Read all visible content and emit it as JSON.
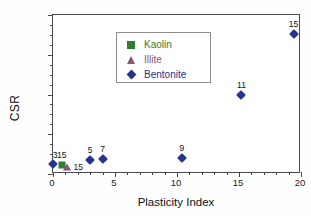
{
  "chart_data": {
    "type": "scatter",
    "title": "",
    "xlabel": "Plasticity Index",
    "ylabel": "CSR",
    "xlim": [
      0,
      20
    ],
    "ylim": [
      0,
      0.2
    ],
    "xticks": [
      "0",
      "5",
      "10",
      "15",
      "20"
    ],
    "yticks": [
      "0.00",
      "0.05",
      "0.10",
      "0.15",
      "0.20"
    ],
    "xtick_values": [
      0,
      5,
      10,
      15,
      20
    ],
    "ytick_values": [
      0.0,
      0.05,
      0.1,
      0.15,
      0.2
    ],
    "x_minor_step": 1,
    "y_minor_step": 0.0125,
    "grid": false,
    "legend_position": "upper-left",
    "series": [
      {
        "name": "Kaolin",
        "marker": "square",
        "color": "#2f7d32",
        "points": [
          {
            "x": 0.7,
            "y": 0.011,
            "label": "15",
            "label_pos": "above"
          }
        ]
      },
      {
        "name": "Illite",
        "marker": "triangle",
        "color": "#8e5374",
        "points": [
          {
            "x": 1.15,
            "y": 0.009,
            "label": "15",
            "label_pos": "right"
          }
        ]
      },
      {
        "name": "Bentonite",
        "marker": "diamond",
        "color": "#26348c",
        "points": [
          {
            "x": 0.0,
            "y": 0.012,
            "label": "3",
            "label_pos": "above-left"
          },
          {
            "x": 3.0,
            "y": 0.018,
            "label": "5",
            "label_pos": "above"
          },
          {
            "x": 4.0,
            "y": 0.019,
            "label": "7",
            "label_pos": "above"
          },
          {
            "x": 10.4,
            "y": 0.02,
            "label": "9",
            "label_pos": "above"
          },
          {
            "x": 15.2,
            "y": 0.1,
            "label": "11",
            "label_pos": "above"
          },
          {
            "x": 19.4,
            "y": 0.176,
            "label": "15",
            "label_pos": "above"
          }
        ]
      }
    ]
  },
  "legend": {
    "items": [
      {
        "label": "Kaolin",
        "color": "#2f7d32",
        "marker": "square"
      },
      {
        "label": "Illite",
        "color": "#8e5374",
        "marker": "triangle"
      },
      {
        "label": "Bentonite",
        "color": "#26348c",
        "marker": "diamond"
      }
    ]
  },
  "axes": {
    "x_title": "Plasticity Index",
    "y_title": "CSR"
  }
}
